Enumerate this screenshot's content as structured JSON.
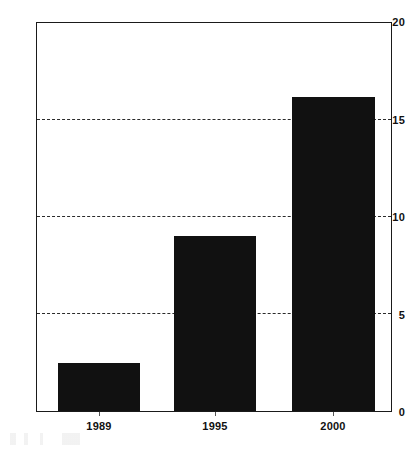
{
  "chart_data": {
    "type": "bar",
    "title": "",
    "subtitle": "",
    "xlabel": "",
    "ylabel": "",
    "categories": [
      "1989",
      "1995",
      "2000"
    ],
    "values": [
      2.5,
      9.0,
      16.2
    ],
    "series": [
      {
        "name": "",
        "values": [
          2.5,
          9.0,
          16.2
        ],
        "color": "#111111"
      }
    ],
    "ylim": [
      0,
      20
    ],
    "yticks": [
      0,
      5,
      10,
      15,
      20
    ],
    "ytick_labels": [
      "0",
      "5",
      "10",
      "15",
      "20"
    ],
    "grid": {
      "horizontal": true,
      "style": "dashed",
      "at": [
        5,
        10,
        15
      ],
      "color": "#2b2b2b"
    },
    "legend": {
      "visible": false,
      "position": "none",
      "entries": []
    },
    "frame": {
      "visible": true,
      "color": "#1a1a1a"
    },
    "annotations": []
  },
  "axes": {
    "y_ticks": [
      {
        "label": "20",
        "value": 20
      },
      {
        "label": "15",
        "value": 15
      },
      {
        "label": "10",
        "value": 10
      },
      {
        "label": "5",
        "value": 5
      },
      {
        "label": "0",
        "value": 0
      }
    ],
    "x_ticks": [
      {
        "label": "1989"
      },
      {
        "label": "1995"
      },
      {
        "label": "2000"
      }
    ]
  }
}
